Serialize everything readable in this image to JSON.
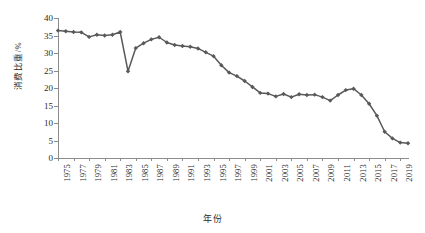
{
  "chart_data": {
    "type": "line",
    "title": "",
    "xlabel": "年份",
    "ylabel": "消费比重/%",
    "xlim": [
      1975,
      2020
    ],
    "ylim": [
      0,
      40
    ],
    "ytick_step": 5,
    "xtick_step": 2,
    "grid": false,
    "legend": "none",
    "series_color": "#595959",
    "marker": "diamond",
    "yticks": [
      "0",
      "5",
      "10",
      "15",
      "20",
      "25",
      "30",
      "35",
      "40"
    ],
    "xticks": [
      "1975",
      "1977",
      "1979",
      "1981",
      "1983",
      "1985",
      "1987",
      "1989",
      "1991",
      "1993",
      "1995",
      "1997",
      "1999",
      "2001",
      "2003",
      "2005",
      "2007",
      "2009",
      "2011",
      "2013",
      "2015",
      "2017",
      "2019"
    ],
    "x": [
      1975,
      1976,
      1977,
      1978,
      1979,
      1980,
      1981,
      1982,
      1983,
      1984,
      1985,
      1986,
      1987,
      1988,
      1989,
      1990,
      1991,
      1992,
      1993,
      1994,
      1995,
      1996,
      1997,
      1998,
      1999,
      2000,
      2001,
      2002,
      2003,
      2004,
      2005,
      2006,
      2007,
      2008,
      2009,
      2010,
      2011,
      2012,
      2013,
      2014,
      2015,
      2016,
      2017,
      2018,
      2019,
      2020
    ],
    "values": [
      36.4,
      36.2,
      36.0,
      35.9,
      34.6,
      35.2,
      35.0,
      35.2,
      36.0,
      24.8,
      31.4,
      32.8,
      33.9,
      34.5,
      33.0,
      32.3,
      32.0,
      31.8,
      31.3,
      30.2,
      29.1,
      26.5,
      24.4,
      23.4,
      22.0,
      20.3,
      18.6,
      18.4,
      17.6,
      18.3,
      17.4,
      18.2,
      18.0,
      18.1,
      17.4,
      16.4,
      18.0,
      19.4,
      19.8,
      18.0,
      15.5,
      12.1,
      7.5,
      5.6,
      4.4,
      4.2
    ],
    "series_name": "消费比重"
  },
  "axis": {
    "y_title": "消费比重/%",
    "x_title": "年份"
  }
}
